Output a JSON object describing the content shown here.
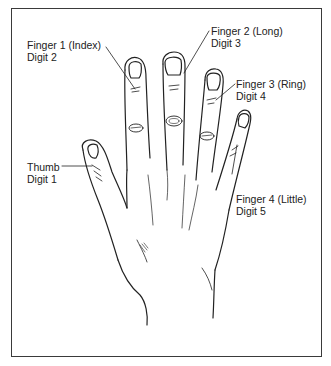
{
  "diagram": {
    "type": "anatomical-illustration",
    "labels": [
      {
        "id": "index",
        "line1": "Finger 1 (Index)",
        "line2": "Digit 2"
      },
      {
        "id": "long",
        "line1": "Finger 2 (Long)",
        "line2": "Digit 3"
      },
      {
        "id": "ring",
        "line1": "Finger 3 (Ring)",
        "line2": "Digit 4"
      },
      {
        "id": "thumb",
        "line1": "Thumb",
        "line2": "Digit 1"
      },
      {
        "id": "little",
        "line1": "Finger 4 (Little)",
        "line2": "Digit 5"
      }
    ],
    "colors": {
      "stroke": "#222222",
      "border": "#3a3a3a",
      "background": "#ffffff"
    }
  }
}
